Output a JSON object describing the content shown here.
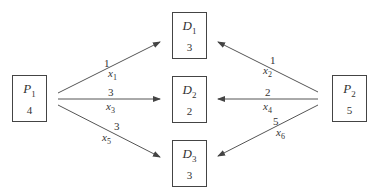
{
  "diagram": {
    "type": "transportation-network",
    "sources": [
      {
        "id": "P1",
        "letter": "P",
        "index": "1",
        "supply": "4"
      },
      {
        "id": "P2",
        "letter": "P",
        "index": "2",
        "supply": "5"
      }
    ],
    "destinations": [
      {
        "id": "D1",
        "letter": "D",
        "index": "1",
        "demand": "3"
      },
      {
        "id": "D2",
        "letter": "D",
        "index": "2",
        "demand": "2"
      },
      {
        "id": "D3",
        "letter": "D",
        "index": "3",
        "demand": "3"
      }
    ],
    "edges": [
      {
        "from": "P1",
        "to": "D1",
        "cost": "1",
        "var_letter": "x",
        "var_index": "1"
      },
      {
        "from": "P1",
        "to": "D2",
        "cost": "3",
        "var_letter": "x",
        "var_index": "3"
      },
      {
        "from": "P1",
        "to": "D3",
        "cost": "3",
        "var_letter": "x",
        "var_index": "5"
      },
      {
        "from": "P2",
        "to": "D1",
        "cost": "1",
        "var_letter": "x",
        "var_index": "2"
      },
      {
        "from": "P2",
        "to": "D2",
        "cost": "2",
        "var_letter": "x",
        "var_index": "4"
      },
      {
        "from": "P2",
        "to": "D3",
        "cost": "5",
        "var_letter": "x",
        "var_index": "6"
      }
    ],
    "colors": {
      "line": "#444444",
      "text": "#333333",
      "background": "#ffffff"
    }
  }
}
